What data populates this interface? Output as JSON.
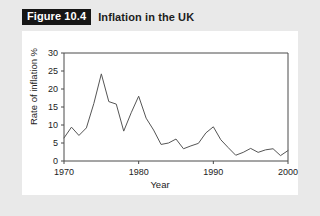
{
  "figure": {
    "badge": "Figure 10.4",
    "title": "Inflation in the UK"
  },
  "colors": {
    "page_background": "#e9e9e9",
    "panel_background": "#ffffff",
    "badge_background": "#161616",
    "badge_text": "#ffffff",
    "title_text": "#1d1d1d",
    "axis": "#4a4a4a",
    "line": "#555555"
  },
  "chart_data": {
    "type": "line",
    "title": "Inflation in the UK",
    "xlabel": "Year",
    "ylabel": "Rate of inflation %",
    "xlim": [
      1970,
      2000
    ],
    "ylim": [
      0,
      30
    ],
    "yticks": [
      0,
      5,
      10,
      15,
      20,
      25,
      30
    ],
    "ytick_labels": [
      "0",
      "5",
      "10",
      "15",
      "20",
      "25",
      "30"
    ],
    "xticks": [
      1970,
      1980,
      1990,
      2000
    ],
    "xtick_labels": [
      "1970",
      "1980",
      "1990",
      "2000"
    ],
    "grid": false,
    "legend": "none",
    "x": [
      1970,
      1971,
      1972,
      1973,
      1974,
      1975,
      1976,
      1977,
      1978,
      1979,
      1980,
      1981,
      1982,
      1983,
      1984,
      1985,
      1986,
      1987,
      1988,
      1989,
      1990,
      1991,
      1992,
      1993,
      1994,
      1995,
      1996,
      1997,
      1998,
      1999,
      2000
    ],
    "values": [
      6.4,
      9.4,
      7.1,
      9.2,
      16.0,
      24.2,
      16.5,
      15.8,
      8.3,
      13.4,
      18.0,
      11.9,
      8.6,
      4.6,
      5.0,
      6.1,
      3.4,
      4.2,
      4.9,
      7.8,
      9.5,
      5.9,
      3.7,
      1.6,
      2.4,
      3.5,
      2.4,
      3.1,
      3.4,
      1.5,
      2.9
    ],
    "series": [
      {
        "name": "Rate of inflation %",
        "values": [
          6.4,
          9.4,
          7.1,
          9.2,
          16.0,
          24.2,
          16.5,
          15.8,
          8.3,
          13.4,
          18.0,
          11.9,
          8.6,
          4.6,
          5.0,
          6.1,
          3.4,
          4.2,
          4.9,
          7.8,
          9.5,
          5.9,
          3.7,
          1.6,
          2.4,
          3.5,
          2.4,
          3.1,
          3.4,
          1.5,
          2.9
        ]
      }
    ]
  }
}
